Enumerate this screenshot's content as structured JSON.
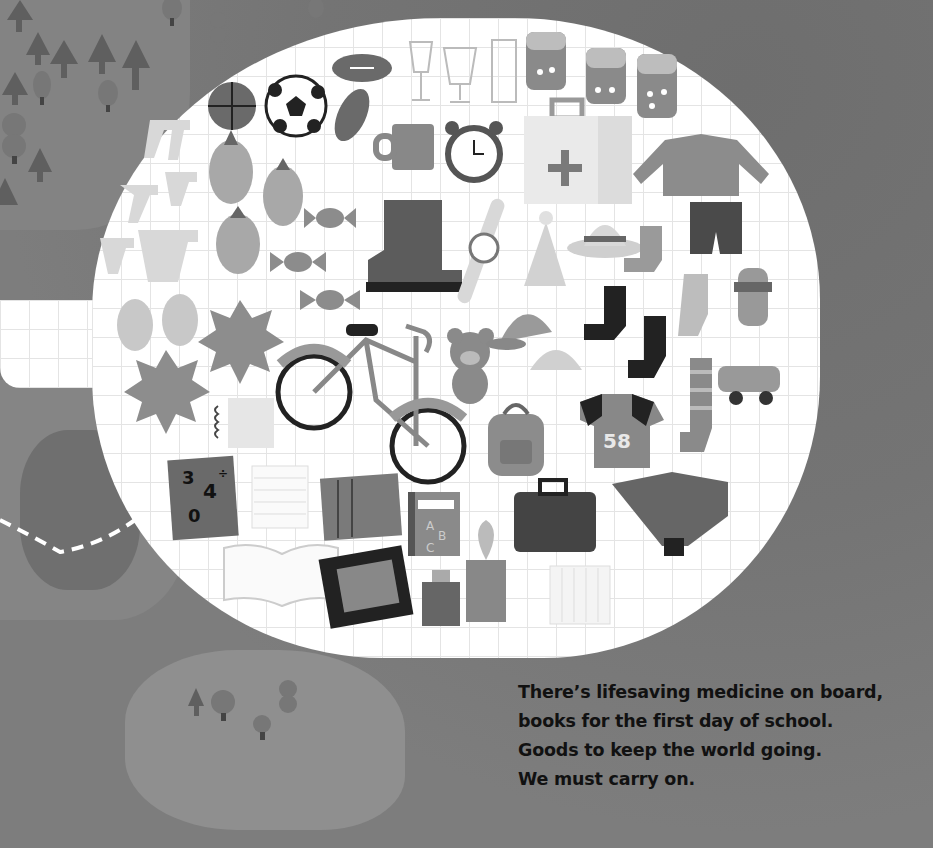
{
  "page": {
    "caption_lines": [
      "There’s lifesaving medicine on board,",
      "books for the first day of school.",
      "Goods to keep the world going.",
      "We must carry on."
    ]
  },
  "illustration": {
    "bubble_items": [
      "bananas",
      "basketball",
      "soccer-ball",
      "football",
      "wine-glasses",
      "medicine-jars",
      "first-aid-kit",
      "sweater",
      "shorts",
      "mug",
      "alarm-clock",
      "pineapples",
      "candies",
      "boot",
      "wristwatch",
      "party-hat",
      "sun-hat",
      "socks",
      "toy-car",
      "mangoes",
      "durians",
      "bicycle",
      "teddy-bear",
      "cap",
      "backpack",
      "jersey",
      "striped-sock",
      "notepad",
      "math-book",
      "lined-paper",
      "notebook",
      "abc-book",
      "briefcase",
      "ankle-boot",
      "open-book",
      "tablet",
      "gift-box",
      "potted-plant",
      "paper-sheet"
    ],
    "jersey_number": "58",
    "math_book_glyphs": "3 4 ÷ 0",
    "abc_book_letters": "A B C",
    "colors": {
      "background": "#7c7c7c",
      "bubble": "#ffffff",
      "grid": "#e4e4e4",
      "caption_text": "#111111"
    }
  }
}
